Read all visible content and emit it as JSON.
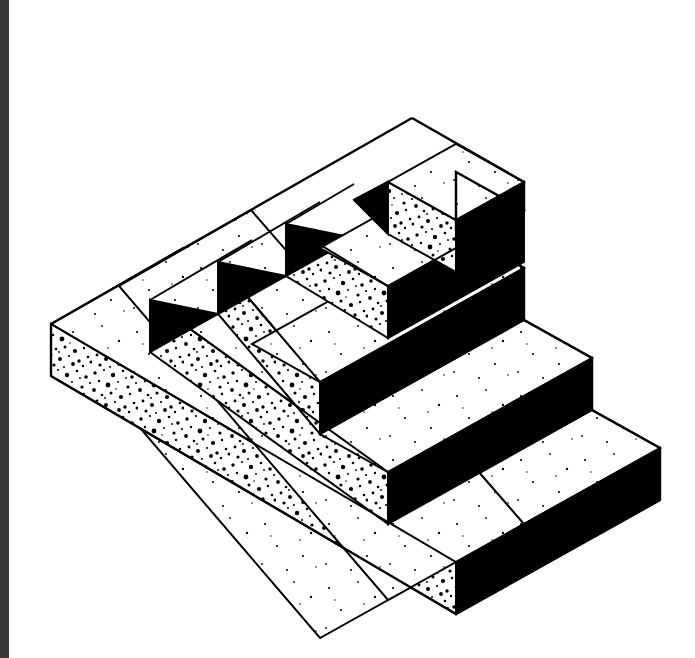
{
  "page": {
    "title": "Isometric Stepped Pyramid",
    "background_color": "#ffffff",
    "width": 695,
    "height": 658
  },
  "artifact": {
    "name": "isometric-stepped-pyramid",
    "description": "Black and white line drawing of a five-tier isometric stepped pyramid (ziggurat) with stippled left faces and solid black right faces",
    "alt_text": "Five-terrace isometric stepped pyramid drawing"
  },
  "scan_band": {
    "name": "left-scan-edge",
    "color": "#3a3a3a",
    "x": 0,
    "y": 0,
    "width": 9,
    "height": 658
  },
  "colors": {
    "ink": "#000000",
    "paper": "#ffffff",
    "shadow": "#000000",
    "stipple": "#111111",
    "scan_edge": "#3a3a3a"
  },
  "chart_data": {
    "type": "diagram",
    "title": "Isometric Stepped Pyramid",
    "projection": "isometric",
    "tier_count": 5,
    "geometry": {
      "apex_vertex": [
        412,
        118
      ],
      "left_vertex": [
        51,
        324
      ],
      "bottom_vertex": [
        456,
        614
      ],
      "right_vertex": [
        660,
        500
      ],
      "step_inset_x": 68,
      "step_inset_y": -22,
      "riser_height": 52,
      "iso_dx_left": -1,
      "iso_dy_left": 0.577
    },
    "tiers": [
      {
        "index": 1,
        "label": "base-tier",
        "top_face": "white",
        "left_riser": "stippled-white",
        "right_riser": "solid-black",
        "inner_corner": "solid-black"
      },
      {
        "index": 2,
        "label": "second-tier",
        "top_face": "white",
        "left_riser": "stippled-white",
        "right_riser": "solid-black",
        "inner_corner": "solid-black"
      },
      {
        "index": 3,
        "label": "third-tier",
        "top_face": "white",
        "left_riser": "stippled-white",
        "right_riser": "solid-black",
        "inner_corner": "solid-black"
      },
      {
        "index": 4,
        "label": "fourth-tier",
        "top_face": "white",
        "left_riser": "stippled-white",
        "right_riser": "solid-black",
        "inner_corner": "solid-black"
      },
      {
        "index": 5,
        "label": "apex-tier",
        "top_face": "white",
        "left_riser": "stippled-white",
        "right_riser": "solid-black",
        "inner_corner": "solid-black"
      }
    ]
  }
}
